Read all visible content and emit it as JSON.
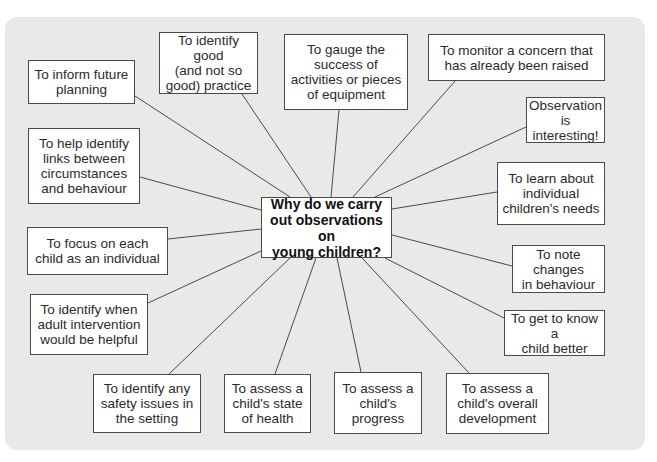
{
  "diagram": {
    "type": "spider-diagram",
    "central_question": {
      "lines": [
        "Why do we carry",
        "out observations on",
        "young children?"
      ]
    },
    "colors": {
      "panel_background": "#e9e9e7",
      "box_background": "#ffffff",
      "box_border": "#4a4a4a",
      "connector": "#4a4a4a",
      "text": "#2a2a2a"
    },
    "reasons": [
      {
        "lines": [
          "To inform future",
          "planning"
        ]
      },
      {
        "lines": [
          "To identify good",
          "(and not so",
          "good) practice"
        ]
      },
      {
        "lines": [
          "To gauge the",
          "success of",
          "activities or pieces",
          "of equipment"
        ]
      },
      {
        "lines": [
          "To monitor a concern that",
          "has already been raised"
        ]
      },
      {
        "lines": [
          "Observation is",
          "interesting!"
        ]
      },
      {
        "lines": [
          "To help identify",
          "links between",
          "circumstances",
          "and behaviour"
        ]
      },
      {
        "lines": [
          "To learn about",
          "individual",
          "children's needs"
        ]
      },
      {
        "lines": [
          "To focus on each",
          "child as an individual"
        ]
      },
      {
        "lines": [
          "To note changes",
          "in behaviour"
        ]
      },
      {
        "lines": [
          "To identify when",
          "adult intervention",
          "would be helpful"
        ]
      },
      {
        "lines": [
          "To get to know a",
          "child better"
        ]
      },
      {
        "lines": [
          "To identify any",
          "safety issues in",
          "the setting"
        ]
      },
      {
        "lines": [
          "To assess a",
          "child's state",
          "of health"
        ]
      },
      {
        "lines": [
          "To assess a",
          "child's",
          "progress"
        ]
      },
      {
        "lines": [
          "To assess a",
          "child's overall",
          "development"
        ]
      }
    ]
  }
}
